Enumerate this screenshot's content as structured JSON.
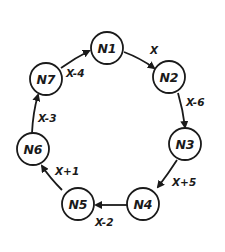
{
  "diagram": {
    "type": "directed-cycle",
    "nodes": [
      {
        "id": "N1",
        "label": "N1"
      },
      {
        "id": "N2",
        "label": "N2"
      },
      {
        "id": "N3",
        "label": "N3"
      },
      {
        "id": "N4",
        "label": "N4"
      },
      {
        "id": "N5",
        "label": "N5"
      },
      {
        "id": "N6",
        "label": "N6"
      },
      {
        "id": "N7",
        "label": "N7"
      }
    ],
    "edges": [
      {
        "from": "N1",
        "to": "N2",
        "label": "X"
      },
      {
        "from": "N2",
        "to": "N3",
        "label": "X-6"
      },
      {
        "from": "N3",
        "to": "N4",
        "label": "X+5"
      },
      {
        "from": "N4",
        "to": "N5",
        "label": "X-2"
      },
      {
        "from": "N5",
        "to": "N6",
        "label": "X+1"
      },
      {
        "from": "N6",
        "to": "N7",
        "label": "X-3"
      },
      {
        "from": "N7",
        "to": "N1",
        "label": "X-4"
      }
    ]
  }
}
